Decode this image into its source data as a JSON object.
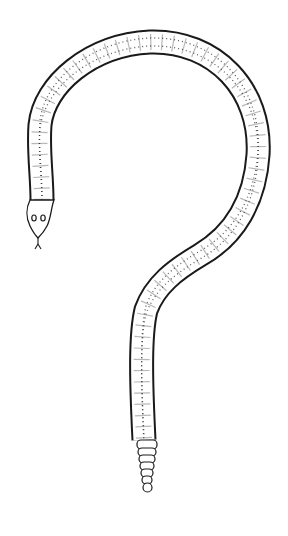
{
  "image": {
    "description": "Line drawing of a rattlesnake curved into the shape of a question mark",
    "subject": "rattlesnake",
    "shape": "question-mark",
    "colors": {
      "background": "#ffffff",
      "outline": "#1a1a1a",
      "pattern_dots": "#333333"
    },
    "parts": {
      "head": "snake-head",
      "body": "snake-body",
      "rattle": "snake-rattle",
      "tongue": "forked-tongue"
    }
  }
}
